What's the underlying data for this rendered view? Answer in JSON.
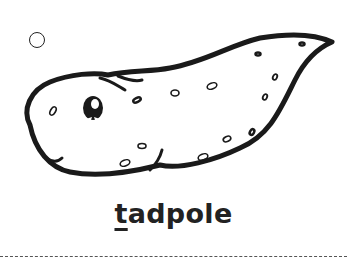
{
  "card": {
    "word": "tadpole",
    "first_letter": "t",
    "rest_letters": "adpole",
    "image_subject": "tadpole",
    "radio_selected": false
  },
  "colors": {
    "ink": "#1a1a1a",
    "background": "#ffffff",
    "dash": "#555555"
  }
}
